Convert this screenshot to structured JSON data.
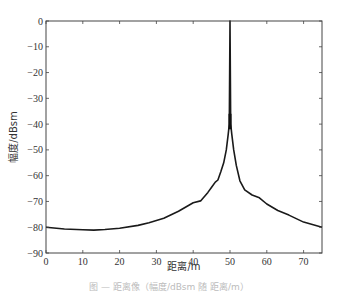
{
  "chart_data": {
    "type": "line",
    "title": "",
    "xlabel": "距离/m",
    "ylabel": "幅度/dBsm",
    "xlim": [
      0,
      75
    ],
    "ylim": [
      -90,
      0
    ],
    "xticks": [
      0,
      10,
      20,
      30,
      40,
      50,
      60,
      70
    ],
    "yticks": [
      0,
      -10,
      -20,
      -30,
      -40,
      -50,
      -60,
      -70,
      -80,
      -90
    ],
    "grid": false,
    "legend": null,
    "series": [
      {
        "name": "RCS profile",
        "color": "#1a1a1a",
        "x": [
          0,
          5,
          10,
          13,
          16,
          20,
          25,
          28,
          32,
          36,
          40,
          42,
          44,
          45,
          46,
          46.7,
          47.5,
          48.3,
          49,
          49.5,
          49.8,
          50,
          50.2,
          50.5,
          51,
          51.7,
          52.7,
          54,
          56,
          58,
          60,
          63,
          66,
          70,
          75
        ],
        "y": [
          -80,
          -80.7,
          -81,
          -81.1,
          -80.9,
          -80.4,
          -79.3,
          -78.3,
          -76.5,
          -73.8,
          -70.5,
          -69.8,
          -66.5,
          -64.5,
          -62.5,
          -61.7,
          -58.5,
          -55,
          -50,
          -44,
          -40,
          0,
          -40,
          -44,
          -50,
          -56,
          -62,
          -65.5,
          -67.5,
          -68.6,
          -71,
          -73.5,
          -75.3,
          -78,
          -80
        ]
      }
    ],
    "annotations": [
      {
        "text": "thickened trace near peak base",
        "x": 50,
        "y": -40
      }
    ]
  },
  "caption": "图 — 距离像（幅度/dBsm 随 距离/m）"
}
